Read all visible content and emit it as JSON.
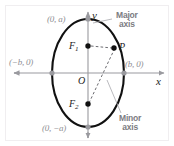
{
  "figure": {
    "type": "ellipse-diagram",
    "caption_labels": {
      "major_axis": "Major\naxis",
      "major_axis_line1": "Major",
      "major_axis_line2": "axis",
      "minor_axis_line1": "Minor",
      "minor_axis_line2": "axis"
    },
    "axis_labels": {
      "x": "x",
      "y": "y",
      "origin": "O"
    },
    "vertex_labels": {
      "top": "(0, a)",
      "bottom": "(0, −a)",
      "left": "(−b, 0)",
      "right": "(b, 0)"
    },
    "point_labels": {
      "focus_upper_base": "F",
      "focus_upper_sub": "1",
      "focus_lower_base": "F",
      "focus_lower_sub": "2",
      "point_p": "P"
    },
    "colors": {
      "curve": "#111111",
      "axis": "#9a9a9f",
      "label_gray": "#8f8f94",
      "label_dark": "#1b1b1b",
      "marker_gray": "#9a9a9f",
      "marker_black": "#111111",
      "frame": "#f0eef0",
      "background": "#ffffff"
    },
    "geometry": {
      "center_x": 88,
      "center_y": 73,
      "semi_minor_b": 36,
      "semi_major_a": 54,
      "focus_upper": {
        "x": 88,
        "y": 46
      },
      "focus_lower": {
        "x": 88,
        "y": 105
      },
      "point_p": {
        "x": 115,
        "y": 48
      },
      "x_axis_range": [
        14,
        166
      ],
      "y_axis_range": [
        10,
        138
      ]
    }
  }
}
